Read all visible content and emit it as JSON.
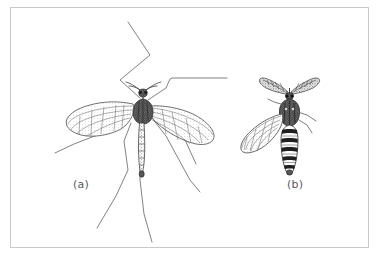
{
  "figure": {
    "kind": "scientific-line-illustration",
    "medium": "pen-and-ink stipple drawing",
    "background_color": "#ffffff",
    "ink_color": "#3a3a3a",
    "frame": {
      "border_color": "#c9c9c9",
      "border_width_px": 1,
      "x": 10,
      "y": 7,
      "width": 359,
      "height": 241
    }
  },
  "panels": [
    {
      "id": "a",
      "label": "(a)",
      "label_x": 73,
      "label_y": 178,
      "common_name": "crane fly",
      "description": "Large slender fly with very long thin legs extending beyond the drawing, two spread veined wings, long narrow segmented abdomen, short antennae.",
      "features": {
        "legs_visible": 6,
        "wings": 2,
        "wing_venation": "visible, with elongate cells",
        "abdomen": "long, narrow, segmented",
        "antennae": "short, filiform",
        "shading": "fine stipple and hatching"
      }
    },
    {
      "id": "b",
      "label": "(b)",
      "label_x": 287,
      "label_y": 178,
      "common_name": "male mosquito",
      "description": "Smaller fly with conspicuous bushy plumose antennae, dark thorax, and a boldly pale-and-dark banded abdomen; one wing spread to the left.",
      "features": {
        "legs_visible": 2,
        "wings": 1,
        "wing_venation": "visible, narrow scaled wing",
        "abdomen": "banded, alternating dark and light segments",
        "antennae": "plumose (feathery), male",
        "shading": "dense stipple with solid dark bands"
      }
    }
  ],
  "labels": {
    "a": "(a)",
    "b": "(b)"
  }
}
